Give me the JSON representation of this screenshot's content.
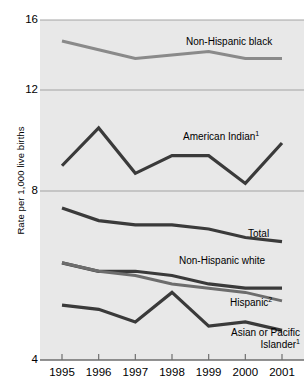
{
  "chart_data": {
    "type": "line",
    "title": "",
    "xlabel": "",
    "ylabel": "Rate per 1,000 live births",
    "x": [
      1995,
      1996,
      1997,
      1998,
      1999,
      2000,
      2001
    ],
    "xticklabels": [
      "1995",
      "1996",
      "1997",
      "1998",
      "1999",
      "2000",
      "2001"
    ],
    "yticklabels": [
      "16",
      "12",
      "8",
      "4"
    ],
    "ytickvalues": [
      16,
      12,
      8,
      4
    ],
    "ylim": [
      4,
      16
    ],
    "grid": true,
    "grid_axis": "y",
    "legend_position": "inline-annotations",
    "axis_note": "Non-uniform (broken) vertical scale; gridlines at 16, 12, 8, 4 are unequally spaced",
    "series": [
      {
        "name": "Non-Hispanic black",
        "label": "Non-Hispanic black",
        "color": "#8a8a8a",
        "width": 3.2,
        "values": [
          14.8,
          14.3,
          13.8,
          14.0,
          14.2,
          13.8,
          13.8
        ]
      },
      {
        "name": "American Indian",
        "label": "American Indian",
        "footnote": "1",
        "color": "#3a3a3a",
        "width": 3.2,
        "values": [
          9.0,
          10.5,
          8.7,
          9.4,
          9.4,
          8.3,
          9.9
        ]
      },
      {
        "name": "Total",
        "label": "Total",
        "color": "#3a3a3a",
        "width": 3.2,
        "values": [
          7.6,
          7.3,
          7.2,
          7.2,
          7.1,
          6.9,
          6.8
        ]
      },
      {
        "name": "Non-Hispanic white",
        "label": "Non-Hispanic white",
        "color": "#3a3a3a",
        "width": 3.2,
        "values": [
          6.3,
          6.1,
          6.1,
          6.0,
          5.8,
          5.7,
          5.7
        ]
      },
      {
        "name": "Hispanic",
        "label": "Hispanic",
        "footnote": "2",
        "color": "#6d6d6d",
        "width": 3.0,
        "values": [
          6.3,
          6.1,
          6.0,
          5.8,
          5.7,
          5.6,
          5.4
        ]
      },
      {
        "name": "Asian or Pacific Islander",
        "label": "Asian or Pacific Islander",
        "label_line1": "Asian or Pacific",
        "label_line2": "Islander",
        "footnote": "1",
        "color": "#3a3a3a",
        "width": 3.2,
        "values": [
          5.3,
          5.2,
          4.9,
          5.6,
          4.8,
          4.9,
          4.7
        ]
      }
    ],
    "annotations": [
      {
        "text": "Non-Hispanic black",
        "series": "Non-Hispanic black"
      },
      {
        "text": "American Indian1",
        "series": "American Indian"
      },
      {
        "text": "Total",
        "series": "Total"
      },
      {
        "text": "Non-Hispanic white",
        "series": "Non-Hispanic white"
      },
      {
        "text": "Hispanic2",
        "series": "Hispanic"
      },
      {
        "text": "Asian or Pacific Islander1",
        "series": "Asian or Pacific Islander"
      }
    ],
    "colors": {
      "plot_background": "#e8e8e8",
      "gridline": "#9b9b9b",
      "axis": "#6f6f6f",
      "text": "#000000"
    }
  }
}
